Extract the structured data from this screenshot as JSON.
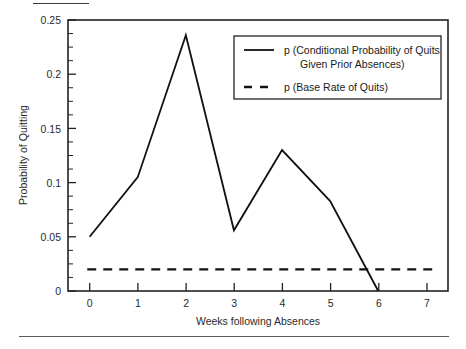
{
  "chart_data": {
    "type": "line",
    "title": "",
    "xlabel": "Weeks following Absences",
    "ylabel": "Probability of Quitting",
    "xlim": [
      -0.45,
      7.45
    ],
    "ylim": [
      0,
      0.25
    ],
    "grid": false,
    "legend_position": "upper-right",
    "x": [
      0,
      1,
      2,
      3,
      4,
      5,
      6
    ],
    "xticks": [
      "0",
      "1",
      "2",
      "3",
      "4",
      "5",
      "6",
      "7"
    ],
    "xtick_values": [
      0,
      1,
      2,
      3,
      4,
      5,
      6,
      7
    ],
    "yticks": [
      "0",
      "0.05",
      "0.1",
      "0.15",
      "0.2",
      "0.25"
    ],
    "ytick_values": [
      0,
      0.05,
      0.1,
      0.15,
      0.2,
      0.25
    ],
    "yminor_step": 0.0125,
    "series": [
      {
        "name": "p (Conditional Probability of Quits Given Prior Absences)",
        "style": "solid",
        "color": "#111111",
        "values": [
          0.05,
          0.105,
          0.236,
          0.056,
          0.13,
          0.083,
          0.0
        ]
      },
      {
        "name": "p (Base Rate of Quits)",
        "style": "dashed",
        "color": "#111111",
        "constant": 0.02,
        "values": [
          0.02,
          0.02,
          0.02,
          0.02,
          0.02,
          0.02,
          0.02
        ]
      }
    ]
  },
  "legend": {
    "entries": [
      {
        "line1": "p (Conditional Probability of Quits",
        "line2": "Given Prior Absences)",
        "style": "solid"
      },
      {
        "line1": "p (Base Rate of Quits)",
        "line2": "",
        "style": "dashed"
      }
    ]
  },
  "axes": {
    "x_title": "Weeks following Absences",
    "y_title": "Probability of Quitting",
    "x_tick_labels": [
      "0",
      "1",
      "2",
      "3",
      "4",
      "5",
      "6",
      "7"
    ],
    "y_tick_labels": [
      "0.25",
      "0.2",
      "0.15",
      "0.1",
      "0.05",
      "0"
    ]
  },
  "colors": {
    "line": "#111111",
    "frame": "#222222",
    "text": "#1a1a1a",
    "background": "#ffffff"
  }
}
